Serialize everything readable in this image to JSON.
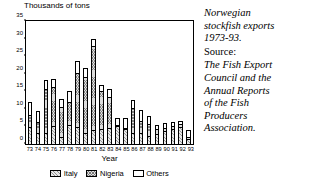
{
  "chart_data": {
    "type": "bar",
    "stacked": true,
    "title": "",
    "ylabel": "Thousands of tons",
    "xlabel": "Year",
    "ylim": [
      0,
      35
    ],
    "yticks": [
      0,
      5,
      10,
      15,
      20,
      25,
      30,
      35
    ],
    "grid": false,
    "legend_position": "bottom",
    "categories": [
      "73",
      "74",
      "75",
      "76",
      "77",
      "78",
      "79",
      "80",
      "81",
      "82",
      "83",
      "84",
      "85",
      "86",
      "87",
      "88",
      "89",
      "90",
      "91",
      "92",
      "93"
    ],
    "series": [
      {
        "name": "Italy",
        "values": [
          4.8,
          3.0,
          3.2,
          5.2,
          2.0,
          5.5,
          4.8,
          3.2,
          4.0,
          4.4,
          4.6,
          5.2,
          4.4,
          3.2,
          3.0,
          2.4,
          2.8,
          3.6,
          4.2,
          4.8,
          1.4
        ]
      },
      {
        "name": "Nigeria",
        "values": [
          3.5,
          3.2,
          12.6,
          11.0,
          8.4,
          6.5,
          15.4,
          15.8,
          24.0,
          10.8,
          8.8,
          0.2,
          0.2,
          7.0,
          3.6,
          3.4,
          1.6,
          1.0,
          1.0,
          0.9,
          0.5
        ]
      },
      {
        "name": "Others",
        "values": [
          3.7,
          3.2,
          2.5,
          2.3,
          2.4,
          3.2,
          3.4,
          2.6,
          2.0,
          1.6,
          2.2,
          2.0,
          2.8,
          2.3,
          3.2,
          2.2,
          1.0,
          1.4,
          1.2,
          0.9,
          2.0
        ]
      }
    ],
    "totals": [
      12.0,
      9.4,
      18.3,
      18.5,
      12.8,
      15.2,
      23.6,
      21.6,
      30.0,
      16.8,
      15.6,
      7.4,
      7.4,
      12.5,
      9.8,
      8.0,
      5.4,
      6.0,
      6.4,
      6.6,
      3.9
    ]
  },
  "axes": {
    "y_title": "Thousands of tons",
    "x_title": "Year",
    "y_tick_labels": [
      "0",
      "5",
      "10",
      "15",
      "20",
      "25",
      "30",
      "35"
    ],
    "x_tick_labels": [
      "73",
      "74",
      "75",
      "76",
      "77",
      "78",
      "79",
      "80",
      "81",
      "82",
      "83",
      "84",
      "85",
      "86",
      "87",
      "88",
      "89",
      "90",
      "91",
      "92",
      "93"
    ]
  },
  "legend": {
    "items": [
      {
        "label": "Italy",
        "pattern": "diagonal-hatch"
      },
      {
        "label": "Nigeria",
        "pattern": "cross-hatch"
      },
      {
        "label": "Others",
        "pattern": "empty"
      }
    ]
  },
  "caption": {
    "line1": "Norwegian",
    "line2": "stockfish exports",
    "line3": "1973-93.",
    "source_label": "Source:",
    "source1": "The Fish Export",
    "source2": "Council and the",
    "source3": "Annual Reports",
    "source4": "of the Fish",
    "source5": "Producers",
    "source6": "Association."
  },
  "colors": {
    "ink": "#000000",
    "background": "#ffffff",
    "italy_fill": "#e8e8e8",
    "nigeria_fill": "#dcdcdc",
    "others_fill": "#ffffff"
  }
}
